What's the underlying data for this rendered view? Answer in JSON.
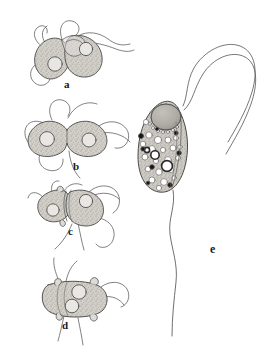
{
  "figure": {
    "type": "scientific-line-drawing",
    "background_color": "#ffffff",
    "ink_color": "#4a4a4a",
    "cytoplasm_fill": "#cdcac4",
    "nucleus_fill": "#b3b0aa",
    "granule_color": "#1a1a1a",
    "vacuole_fill": "#ffffff"
  },
  "panels": [
    {
      "id": "a",
      "label": "a",
      "caption": "two pear-shaped gametes attached at their anterior ends",
      "cell_count": 2,
      "nuclei": 2,
      "flagella": 4
    },
    {
      "id": "b",
      "label": "b",
      "caption": "fusing pair forming a dumbbell with narrow isthmus",
      "cell_count": 2,
      "nuclei": 2,
      "flagella": 4
    },
    {
      "id": "c",
      "label": "c",
      "caption": "partially fused pair, unequal cells side by side",
      "cell_count": 2,
      "nuclei": 2,
      "flagella": 4
    },
    {
      "id": "d",
      "label": "d",
      "caption": "completed fusion, rounded oblong zygote with two nuclei and papillae",
      "cell_count": 1,
      "nuclei": 2,
      "flagella": 4
    },
    {
      "id": "e",
      "label": "e",
      "caption": "detailed single flagellate: large anterior nucleus, vacuolated cytoplasm, dark granules, two long anterior flagella and one trailing flagellum",
      "cell_count": 1,
      "nuclei": 1,
      "anterior_flagella": 2,
      "trailing_flagella": 1
    }
  ]
}
